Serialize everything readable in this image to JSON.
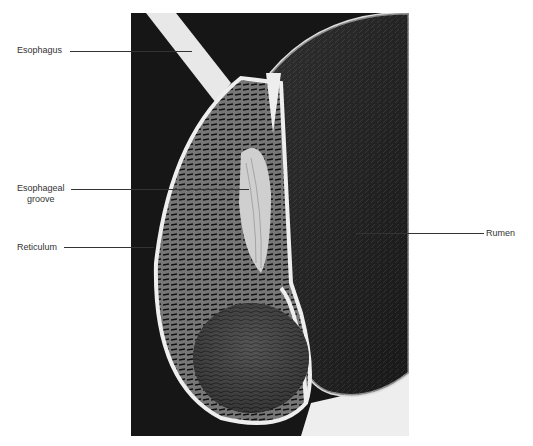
{
  "figure": {
    "labels": [
      {
        "id": "esophagus",
        "text": "Esophagus"
      },
      {
        "id": "esophageal-groove",
        "line1": "Esophageal",
        "line2": "groove"
      },
      {
        "id": "reticulum",
        "text": "Reticulum"
      },
      {
        "id": "rumen",
        "text": "Rumen"
      }
    ]
  }
}
